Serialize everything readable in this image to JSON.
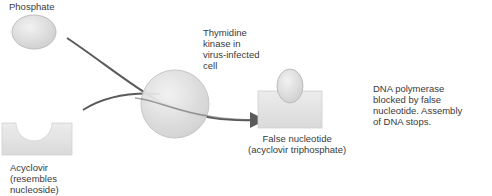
{
  "diagram": {
    "labels": {
      "phosphate": "Phosphate",
      "acyclovir": "Acyclovir\n(resembles\nnucleoside)",
      "kinase": "Thymidine\nkinase in\nvirus-infected\ncell",
      "false_nucleotide": "False nucleotide\n(acyclovir triphosphate)",
      "polymerase": "DNA polymerase\nblocked by false\nnucleotide. Assembly\nof DNA stops."
    },
    "colors": {
      "shape_fill": "#dcdcdc",
      "shape_stroke": "#bdbdbd",
      "arrow": "#5a5a5a",
      "text": "#3a3a3a"
    }
  }
}
